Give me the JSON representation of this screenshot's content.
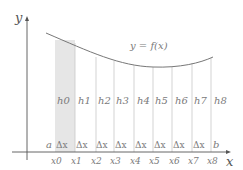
{
  "diagram": {
    "axes": {
      "x_label": "x",
      "y_label": "y"
    },
    "curve_label": "y = f(x)",
    "interval": {
      "start_label": "a",
      "end_label": "b"
    },
    "partition_points": [
      "x0",
      "x1",
      "x2",
      "x3",
      "x4",
      "x5",
      "x6",
      "x7",
      "x8"
    ],
    "heights": [
      "h0",
      "h1",
      "h2",
      "h3",
      "h4",
      "h5",
      "h6",
      "h7",
      "h8"
    ],
    "subinterval_label": "Δx",
    "subinterval_count": 8,
    "highlighted_strip": "h0",
    "colors": {
      "axis": "#555555",
      "curve": "#777777",
      "grid_line": "#c8c8c8",
      "shaded_strip": "#e6e6e6",
      "label": "#7a7a7a"
    }
  }
}
